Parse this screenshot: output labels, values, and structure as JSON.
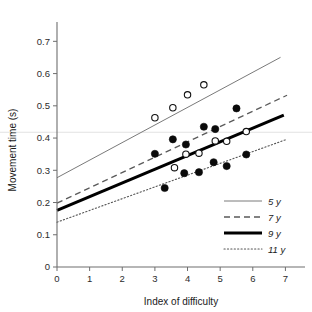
{
  "chart_data": {
    "type": "scatter",
    "title": "",
    "xlabel": "Index of difficulty",
    "ylabel": "Movement time (s)",
    "xlim": [
      0,
      7.6
    ],
    "ylim": [
      0,
      0.76
    ],
    "xticks": [
      "0",
      "1",
      "2",
      "3",
      "4",
      "5",
      "6",
      "7"
    ],
    "xtick_values": [
      0,
      1,
      2,
      3,
      4,
      5,
      6,
      7
    ],
    "yticks": [
      "0",
      "0.1",
      "0.2",
      "0.3",
      "0.4",
      "0.5",
      "0.6",
      "0.7"
    ],
    "ytick_values": [
      0,
      0.1,
      0.2,
      0.3,
      0.4,
      0.5,
      0.6,
      0.7
    ],
    "grid": false,
    "legend_position": "bottom-right",
    "series": [
      {
        "name": "5 y",
        "marker": "open-circle",
        "line_style": "solid-thin",
        "fit": {
          "intercept": 0.277,
          "slope": 0.0545,
          "x_from": 0,
          "x_to": 6.85
        },
        "points": [
          {
            "x": 3.0,
            "y": 0.463
          },
          {
            "x": 3.55,
            "y": 0.494
          },
          {
            "x": 4.0,
            "y": 0.534
          },
          {
            "x": 4.5,
            "y": 0.565
          }
        ]
      },
      {
        "name": "7 y",
        "marker": "open-circle",
        "line_style": "dashed",
        "fit": {
          "intercept": 0.198,
          "slope": 0.0475,
          "x_from": 0,
          "x_to": 7.05
        },
        "points": [
          {
            "x": 3.6,
            "y": 0.308
          },
          {
            "x": 3.95,
            "y": 0.35
          },
          {
            "x": 4.35,
            "y": 0.353
          },
          {
            "x": 4.85,
            "y": 0.391
          },
          {
            "x": 5.2,
            "y": 0.39
          },
          {
            "x": 5.8,
            "y": 0.42
          }
        ]
      },
      {
        "name": "9 y",
        "marker": "filled-circle",
        "line_style": "solid-thick",
        "fit": {
          "intercept": 0.176,
          "slope": 0.0425,
          "x_from": 0,
          "x_to": 6.95
        },
        "points": [
          {
            "x": 3.0,
            "y": 0.351
          },
          {
            "x": 3.55,
            "y": 0.396
          },
          {
            "x": 3.95,
            "y": 0.38
          },
          {
            "x": 4.5,
            "y": 0.435
          },
          {
            "x": 4.85,
            "y": 0.428
          },
          {
            "x": 5.5,
            "y": 0.492
          }
        ]
      },
      {
        "name": "11 y",
        "marker": "filled-circle",
        "line_style": "dotted",
        "fit": {
          "intercept": 0.139,
          "slope": 0.0365,
          "x_from": 0,
          "x_to": 7.0
        },
        "points": [
          {
            "x": 3.3,
            "y": 0.245
          },
          {
            "x": 3.9,
            "y": 0.291
          },
          {
            "x": 4.35,
            "y": 0.294
          },
          {
            "x": 4.8,
            "y": 0.325
          },
          {
            "x": 5.2,
            "y": 0.313
          },
          {
            "x": 5.8,
            "y": 0.349
          }
        ]
      }
    ],
    "legend": [
      {
        "label": "5 y",
        "style": "solid-thin"
      },
      {
        "label": "7 y",
        "style": "dashed"
      },
      {
        "label": "9 y",
        "style": "solid-thick"
      },
      {
        "label": "11 y",
        "style": "dotted"
      }
    ]
  }
}
